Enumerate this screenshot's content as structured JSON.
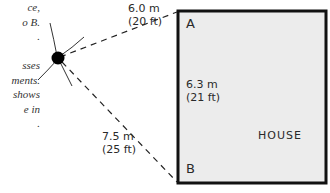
{
  "caption": {
    "lines": [
      "ce,",
      "o B.",
      ".",
      "",
      "sses",
      "ments.",
      "shows",
      "e in",
      "."
    ]
  },
  "diagram": {
    "observer": {
      "x": 58,
      "y": 58,
      "label": "observation point"
    },
    "house": {
      "label": "HOUSE",
      "corner_a": "A",
      "corner_b": "B",
      "fill": "#ececec",
      "stroke": "#111111"
    },
    "measurements": {
      "observer_to_a": {
        "metric": "6.0 m",
        "imperial": "(20 ft)"
      },
      "a_to_b": {
        "metric": "6.3 m",
        "imperial": "(21 ft)"
      },
      "observer_to_b": {
        "metric": "7.5 m",
        "imperial": "(25 ft)"
      }
    }
  }
}
